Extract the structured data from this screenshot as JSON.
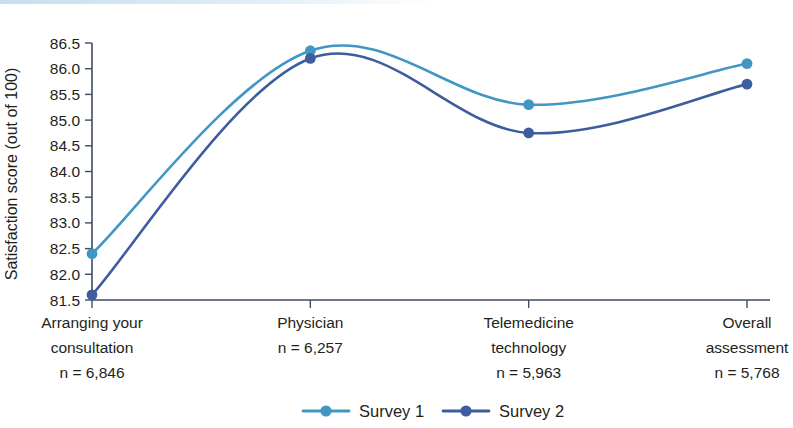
{
  "chart_data": {
    "type": "line",
    "title": "",
    "subtitle": "",
    "xlabel": "",
    "ylabel": "Satisfaction score (out of 100)",
    "categories": [
      "Arranging your consultation",
      "Physician",
      "Telemedicine technology",
      "Overall assessment"
    ],
    "category_lines": [
      [
        "Arranging your",
        "consultation",
        "n = 6,846"
      ],
      [
        "Physician",
        "n = 6,257"
      ],
      [
        "Telemedicine",
        "technology",
        "n = 5,963"
      ],
      [
        "Overall",
        "assessment",
        "n = 5,768"
      ]
    ],
    "sample_sizes": [
      "n = 6,846",
      "n = 6,257",
      "n = 5,963",
      "n = 5,768"
    ],
    "series": [
      {
        "name": "Survey 1",
        "color": "#4296c4",
        "values": [
          82.4,
          86.35,
          85.3,
          86.1
        ]
      },
      {
        "name": "Survey 2",
        "color": "#3e5d9e",
        "values": [
          81.6,
          86.2,
          84.75,
          85.7
        ]
      }
    ],
    "ylim": [
      81.5,
      86.5
    ],
    "ytick_labels": [
      "81.5",
      "82.0",
      "82.5",
      "83.0",
      "83.5",
      "84.0",
      "84.5",
      "85.0",
      "85.5",
      "86.0",
      "86.5"
    ],
    "ytick_values": [
      81.5,
      82.0,
      82.5,
      83.0,
      83.5,
      84.0,
      84.5,
      85.0,
      85.5,
      86.0,
      86.5
    ],
    "grid": false,
    "legend_position": "bottom",
    "legend": [
      "Survey 1",
      "Survey 2"
    ],
    "smoothing": "spline",
    "marker": "circle",
    "axis_color": "#3f4a6b"
  },
  "legend": {
    "items": [
      {
        "label": "Survey 1",
        "color": "#4296c4"
      },
      {
        "label": "Survey 2",
        "color": "#3e5d9e"
      }
    ]
  }
}
